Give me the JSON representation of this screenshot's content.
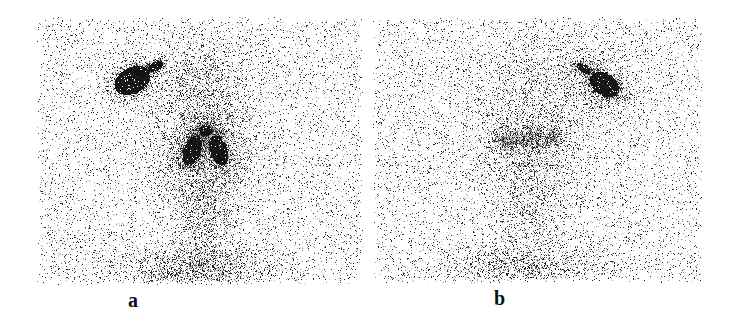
{
  "figure": {
    "panels": [
      {
        "id": "a",
        "label": "a",
        "region": {
          "x": 36,
          "y": 16,
          "w": 328,
          "h": 270
        },
        "label_pos": {
          "x": 128,
          "y": 290
        },
        "background_density": 0.09,
        "seed": 17,
        "blobs": [
          {
            "name": "hot-spot-upper-left",
            "cx": 132,
            "cy": 80,
            "rx": 22,
            "ry": 15,
            "rot": -28,
            "peak": 1.0,
            "core": 0.75
          },
          {
            "name": "hot-spot-tail",
            "cx": 155,
            "cy": 66,
            "rx": 12,
            "ry": 6,
            "rot": -28,
            "peak": 0.85,
            "core": 0.5
          },
          {
            "name": "central-left-lobe",
            "cx": 192,
            "cy": 150,
            "rx": 11,
            "ry": 20,
            "rot": 20,
            "peak": 1.0,
            "core": 0.6
          },
          {
            "name": "central-right-lobe",
            "cx": 218,
            "cy": 150,
            "rx": 11,
            "ry": 20,
            "rot": -20,
            "peak": 1.0,
            "core": 0.6
          },
          {
            "name": "central-apex",
            "cx": 205,
            "cy": 130,
            "rx": 10,
            "ry": 8,
            "rot": 0,
            "peak": 0.95,
            "core": 0.5
          },
          {
            "name": "central-halo",
            "cx": 205,
            "cy": 145,
            "rx": 50,
            "ry": 55,
            "rot": 0,
            "peak": 0.35,
            "core": 0.0
          },
          {
            "name": "upper-halo",
            "cx": 200,
            "cy": 80,
            "rx": 45,
            "ry": 40,
            "rot": 0,
            "peak": 0.2,
            "core": 0.0
          },
          {
            "name": "neck-column",
            "cx": 205,
            "cy": 215,
            "rx": 28,
            "ry": 45,
            "rot": 0,
            "peak": 0.28,
            "core": 0.0
          },
          {
            "name": "lower-chest",
            "cx": 195,
            "cy": 268,
            "rx": 70,
            "ry": 22,
            "rot": 0,
            "peak": 0.42,
            "core": 0.0
          }
        ]
      },
      {
        "id": "b",
        "label": "b",
        "region": {
          "x": 372,
          "y": 16,
          "w": 332,
          "h": 268
        },
        "label_pos": {
          "x": 494,
          "y": 288
        },
        "background_density": 0.09,
        "seed": 41,
        "blobs": [
          {
            "name": "hot-spot-upper-right",
            "cx": 604,
            "cy": 84,
            "rx": 19,
            "ry": 13,
            "rot": 32,
            "peak": 1.0,
            "core": 0.7
          },
          {
            "name": "hot-spot-tail",
            "cx": 583,
            "cy": 68,
            "rx": 12,
            "ry": 6,
            "rot": 32,
            "peak": 0.8,
            "core": 0.4
          },
          {
            "name": "hot-spot-halo",
            "cx": 600,
            "cy": 85,
            "rx": 40,
            "ry": 30,
            "rot": 30,
            "peak": 0.22,
            "core": 0.0
          },
          {
            "name": "central-diffuse-left",
            "cx": 508,
            "cy": 140,
            "rx": 16,
            "ry": 12,
            "rot": 0,
            "peak": 0.55,
            "core": 0.0
          },
          {
            "name": "central-diffuse-mid",
            "cx": 532,
            "cy": 138,
            "rx": 14,
            "ry": 12,
            "rot": 0,
            "peak": 0.5,
            "core": 0.0
          },
          {
            "name": "central-diffuse-right",
            "cx": 553,
            "cy": 136,
            "rx": 10,
            "ry": 10,
            "rot": 0,
            "peak": 0.45,
            "core": 0.0
          },
          {
            "name": "central-halo",
            "cx": 528,
            "cy": 145,
            "rx": 55,
            "ry": 50,
            "rot": 0,
            "peak": 0.25,
            "core": 0.0
          },
          {
            "name": "upper-halo",
            "cx": 530,
            "cy": 80,
            "rx": 60,
            "ry": 40,
            "rot": 0,
            "peak": 0.12,
            "core": 0.0
          },
          {
            "name": "neck-column",
            "cx": 530,
            "cy": 210,
            "rx": 30,
            "ry": 45,
            "rot": 0,
            "peak": 0.16,
            "core": 0.0
          },
          {
            "name": "lower-chest",
            "cx": 520,
            "cy": 265,
            "rx": 75,
            "ry": 20,
            "rot": 0,
            "peak": 0.28,
            "core": 0.0
          }
        ]
      }
    ]
  }
}
